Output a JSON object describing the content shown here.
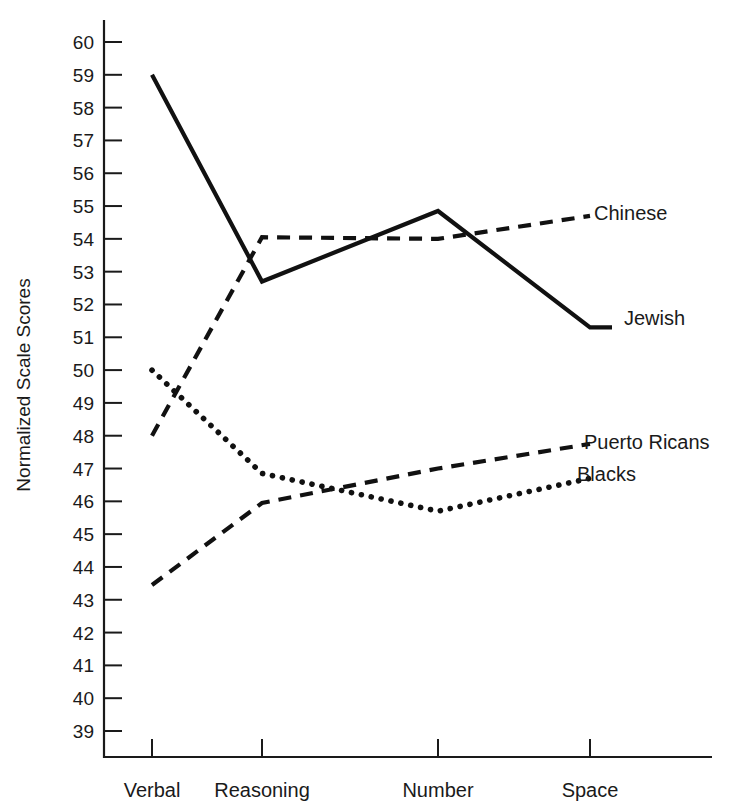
{
  "chart_data": {
    "type": "line",
    "title": "",
    "xlabel": "",
    "ylabel": "Normalized Scale Scores",
    "categories": [
      "Verbal",
      "Reasoning",
      "Number",
      "Space"
    ],
    "ylim": [
      39,
      60
    ],
    "yticks": [
      60,
      59,
      58,
      57,
      56,
      55,
      54,
      53,
      52,
      51,
      50,
      49,
      48,
      47,
      46,
      45,
      44,
      43,
      42,
      41,
      40,
      39
    ],
    "grid": false,
    "legend_position": "right-inline-labels",
    "series": [
      {
        "name": "Jewish",
        "style": "solid",
        "color": "#111111",
        "values": [
          59.0,
          52.7,
          54.85,
          51.3
        ]
      },
      {
        "name": "Chinese",
        "style": "dashed",
        "color": "#111111",
        "values": [
          48.0,
          54.05,
          54.0,
          54.7
        ]
      },
      {
        "name": "Puerto Ricans",
        "style": "dashed",
        "color": "#111111",
        "values": [
          43.45,
          45.95,
          47.0,
          47.75
        ]
      },
      {
        "name": "Blacks",
        "style": "dotted",
        "color": "#111111",
        "values": [
          50.0,
          46.85,
          45.7,
          46.7
        ]
      }
    ],
    "annotations": [
      {
        "text": "Chinese",
        "value": 54.7
      },
      {
        "text": "Jewish",
        "value": 51.3
      },
      {
        "text": "Puerto Ricans",
        "value": 47.75
      },
      {
        "text": "Blacks",
        "value": 46.7
      }
    ]
  }
}
